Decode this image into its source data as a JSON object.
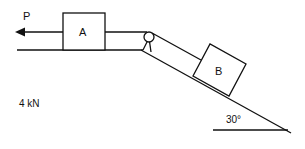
{
  "diagram": {
    "force_label": "P",
    "block_a_label": "A",
    "block_b_label": "B",
    "weight_label": "4 kN",
    "angle_label": "30°",
    "colors": {
      "line": "#111111",
      "background": "#ffffff"
    }
  }
}
